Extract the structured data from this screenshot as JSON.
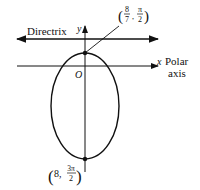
{
  "diagram": {
    "type": "polar-conic-ellipse",
    "directrix_label": "Directrix",
    "y_axis_label": "y",
    "x_axis_label": "x",
    "polar_axis_label_line1": "Polar",
    "polar_axis_label_line2": "axis",
    "origin_label": "O",
    "top_vertex": {
      "r_num": "8",
      "r_den": "7",
      "theta_num": "π",
      "theta_den": "2"
    },
    "bottom_vertex": {
      "r": "8,",
      "theta_num": "3π",
      "theta_den": "2"
    },
    "colors": {
      "stroke": "#111111",
      "background": "#ffffff"
    }
  }
}
